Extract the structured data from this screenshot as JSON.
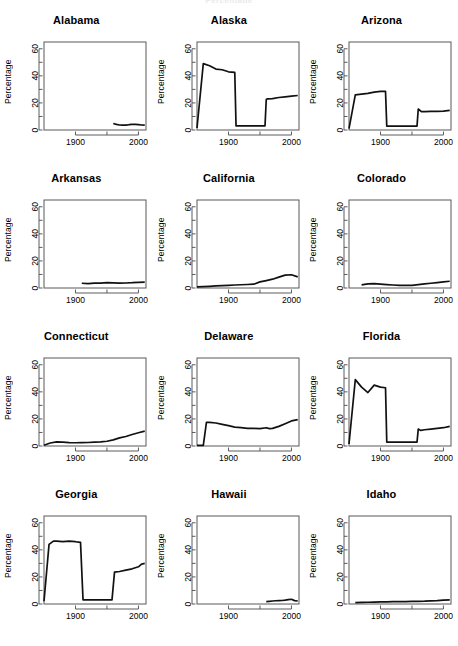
{
  "figure": {
    "title_fragment": "Percentage",
    "ylabel": "Percentage",
    "xlabel": "",
    "ylim": [
      0,
      65
    ],
    "xlim": [
      1850,
      2012
    ],
    "y_ticks": [
      0,
      10,
      20,
      30,
      40,
      50,
      60
    ],
    "y_tick_labels": [
      "0",
      "",
      "20",
      "",
      "40",
      "",
      "60"
    ],
    "x_ticks": [
      1900,
      1950,
      2000
    ],
    "x_tick_labels": [
      "1900",
      "",
      "2000"
    ],
    "rows": 4,
    "cols": 3,
    "line_color": "#111111",
    "axis_color": "#4a4a4a"
  },
  "chart_data": {
    "type": "line",
    "title": "Percentage",
    "xlabel": "",
    "ylabel": "Percentage",
    "xlim": [
      1850,
      2012
    ],
    "ylim": [
      0,
      65
    ],
    "grid": false,
    "legend": "none",
    "layout": "small-multiples 4 rows x 3 cols",
    "x_tick_labels": [
      "1900",
      "2000"
    ],
    "y_tick_labels": [
      "0",
      "20",
      "40",
      "60"
    ],
    "panels": [
      {
        "name": "Alabama",
        "x": [
          1960,
          1965,
          1970,
          1975,
          1980,
          1985,
          1990,
          1995,
          2000,
          2005,
          2010
        ],
        "y": [
          4.8,
          4.2,
          3.7,
          3.6,
          3.6,
          3.9,
          4.1,
          4.2,
          4.0,
          3.7,
          3.6
        ]
      },
      {
        "name": "Alaska",
        "x": [
          1850,
          1860,
          1870,
          1880,
          1890,
          1900,
          1910,
          1912,
          1920,
          1930,
          1940,
          1950,
          1958,
          1960,
          1962,
          1970,
          1980,
          1990,
          2000,
          2010
        ],
        "y": [
          1.5,
          49.0,
          47.5,
          45.0,
          44.5,
          43.0,
          42.5,
          3.0,
          3.0,
          3.0,
          3.0,
          3.0,
          3.0,
          22.5,
          23.0,
          23.2,
          24.0,
          24.5,
          25.0,
          25.5
        ]
      },
      {
        "name": "Arizona",
        "x": [
          1850,
          1860,
          1870,
          1880,
          1890,
          1900,
          1908,
          1910,
          1920,
          1930,
          1940,
          1950,
          1958,
          1960,
          1965,
          1970,
          1980,
          1990,
          2000,
          2010
        ],
        "y": [
          1.0,
          26.0,
          26.5,
          27.0,
          28.0,
          28.5,
          28.5,
          2.8,
          2.8,
          2.8,
          2.8,
          2.8,
          2.8,
          15.5,
          13.5,
          13.5,
          13.8,
          13.8,
          14.0,
          14.5
        ]
      },
      {
        "name": "Arkansas",
        "x": [
          1910,
          1920,
          1930,
          1940,
          1950,
          1960,
          1970,
          1980,
          1990,
          2000,
          2010
        ],
        "y": [
          3.5,
          3.2,
          3.6,
          3.6,
          4.0,
          3.8,
          3.6,
          3.7,
          3.9,
          4.2,
          4.3
        ]
      },
      {
        "name": "California",
        "x": [
          1850,
          1860,
          1870,
          1880,
          1890,
          1900,
          1910,
          1920,
          1930,
          1940,
          1950,
          1960,
          1970,
          1980,
          1990,
          2000,
          2010
        ],
        "y": [
          0.8,
          1.0,
          1.2,
          1.5,
          1.8,
          2.0,
          2.2,
          2.4,
          2.6,
          2.8,
          4.5,
          5.5,
          6.5,
          8.0,
          9.5,
          9.8,
          8.2
        ]
      },
      {
        "name": "Colorado",
        "x": [
          1870,
          1880,
          1890,
          1900,
          1910,
          1920,
          1930,
          1940,
          1950,
          1960,
          1970,
          1980,
          1990,
          2000,
          2010
        ],
        "y": [
          2.3,
          3.0,
          3.2,
          2.8,
          2.5,
          2.2,
          2.0,
          1.9,
          2.0,
          2.5,
          3.0,
          3.5,
          4.0,
          4.5,
          5.0
        ]
      },
      {
        "name": "Connecticut",
        "x": [
          1850,
          1860,
          1870,
          1880,
          1890,
          1900,
          1910,
          1920,
          1930,
          1940,
          1950,
          1960,
          1970,
          1980,
          1990,
          2000,
          2010
        ],
        "y": [
          0.5,
          2.2,
          3.0,
          2.8,
          2.5,
          2.4,
          2.5,
          2.6,
          2.8,
          3.0,
          3.5,
          4.5,
          6.0,
          7.0,
          8.5,
          9.8,
          11.0
        ]
      },
      {
        "name": "Delaware",
        "x": [
          1850,
          1860,
          1865,
          1870,
          1880,
          1890,
          1900,
          1910,
          1920,
          1930,
          1940,
          1950,
          1960,
          1965,
          1970,
          1980,
          1990,
          2000,
          2010
        ],
        "y": [
          0.5,
          0.5,
          17.5,
          17.5,
          17.0,
          16.0,
          15.0,
          14.0,
          13.5,
          13.0,
          13.0,
          12.8,
          13.5,
          12.8,
          13.0,
          14.5,
          16.5,
          18.5,
          19.5
        ]
      },
      {
        "name": "Florida",
        "x": [
          1850,
          1860,
          1870,
          1880,
          1890,
          1900,
          1908,
          1910,
          1920,
          1930,
          1940,
          1950,
          1958,
          1960,
          1964,
          1970,
          1980,
          1990,
          2000,
          2010
        ],
        "y": [
          1.5,
          49.0,
          43.5,
          39.5,
          45.0,
          43.5,
          43.0,
          2.8,
          2.8,
          2.8,
          2.8,
          2.8,
          2.8,
          12.5,
          11.5,
          12.0,
          12.5,
          13.0,
          13.5,
          14.5
        ]
      },
      {
        "name": "Georgia",
        "x": [
          1850,
          1858,
          1865,
          1870,
          1880,
          1890,
          1900,
          1908,
          1912,
          1920,
          1930,
          1940,
          1950,
          1958,
          1962,
          1970,
          1980,
          1990,
          2000,
          2005,
          2010
        ],
        "y": [
          2.0,
          44.0,
          46.5,
          46.5,
          46.0,
          46.5,
          46.0,
          45.5,
          3.0,
          3.0,
          3.0,
          3.0,
          3.0,
          3.0,
          23.5,
          24.0,
          25.0,
          26.0,
          27.5,
          29.5,
          30.0
        ]
      },
      {
        "name": "Hawaii",
        "x": [
          1960,
          1965,
          1970,
          1975,
          1980,
          1985,
          1990,
          1995,
          2000,
          2005,
          2010
        ],
        "y": [
          1.8,
          2.0,
          2.2,
          2.4,
          2.5,
          2.6,
          2.8,
          3.2,
          3.5,
          2.5,
          2.2
        ]
      },
      {
        "name": "Idaho",
        "x": [
          1860,
          1870,
          1880,
          1890,
          1900,
          1910,
          1920,
          1930,
          1940,
          1950,
          1960,
          1970,
          1980,
          1990,
          2000,
          2010
        ],
        "y": [
          1.0,
          1.2,
          1.3,
          1.4,
          1.5,
          1.6,
          1.7,
          1.7,
          1.8,
          1.9,
          2.0,
          2.1,
          2.3,
          2.5,
          2.8,
          3.0
        ]
      }
    ]
  }
}
